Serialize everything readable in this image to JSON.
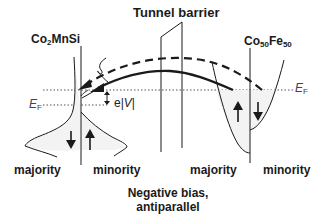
{
  "diagram": {
    "title": "Negative bias, antiparallel",
    "caption_line1": "Negative bias,",
    "caption_line2": "antiparallel",
    "barrier_label": "Tunnel barrier",
    "left_electrode": {
      "name_base": "Co",
      "name_sub": "2",
      "name_rest": "MnSi",
      "fermi_label": "E",
      "fermi_sub": "F",
      "left_band_label": "majority",
      "right_band_label": "minority",
      "left_spin": "down",
      "right_spin": "up"
    },
    "right_electrode": {
      "name_base1": "Co",
      "name_sub1": "50",
      "name_base2": "Fe",
      "name_sub2": "50",
      "fermi_label": "E",
      "fermi_sub": "F",
      "left_band_label": "majority",
      "right_band_label": "minority",
      "left_spin": "up",
      "right_spin": "down"
    },
    "bias_label": "e|V|",
    "bias_label_e": "e",
    "bias_label_v": "V",
    "arrows": [
      {
        "style": "dashed",
        "description": "minority/majority tunneling path, spin-flip"
      },
      {
        "style": "solid",
        "description": "majority tunneling path"
      }
    ],
    "colors": {
      "line": "#1a1a1a",
      "dotted": "#555555",
      "fill": "#f3f3f3"
    }
  }
}
